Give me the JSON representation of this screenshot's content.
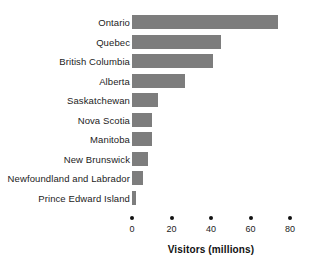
{
  "chart_data": {
    "type": "bar",
    "orientation": "horizontal",
    "title": "",
    "subtitle": "",
    "xlabel": "Visitors (millions)",
    "ylabel": "",
    "categories": [
      "Ontario",
      "Quebec",
      "British Columbia",
      "Alberta",
      "Saskatchewan",
      "Nova Scotia",
      "Manitoba",
      "New Brunswick",
      "Newfoundland and Labrador",
      "Prince Edward Island"
    ],
    "values": [
      74,
      45,
      41,
      27,
      13,
      10,
      10,
      8,
      5.5,
      2
    ],
    "xlim": [
      0,
      80
    ],
    "xticks": [
      0,
      20,
      40,
      60,
      80
    ],
    "xtick_labels": [
      "0",
      "20",
      "40",
      "60",
      "80"
    ],
    "grid": false,
    "legend": false,
    "legend_position": "none",
    "bar_color": "#7d7d7d",
    "text_color": "#1c1c1c",
    "background_color": "#ffffff"
  }
}
